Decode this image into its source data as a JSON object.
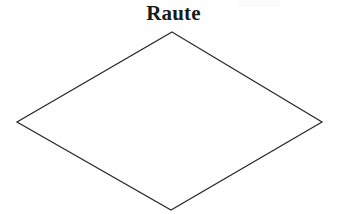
{
  "figure": {
    "title": "Raute",
    "title_color": "#1a1a1a",
    "background_color": "#ffffff",
    "width": 347,
    "height": 214
  },
  "shape": {
    "name": "Raute",
    "kind": "rhombus",
    "fill_color": "#ffffff",
    "stroke_color": "#2b2b2b",
    "stroke_width": 1.25,
    "points": "172,32 322,122 171,210 17,122",
    "vertices": [
      {
        "label": "top",
        "x": 172,
        "y": 32
      },
      {
        "label": "right",
        "x": 322,
        "y": 122
      },
      {
        "label": "bottom",
        "x": 171,
        "y": 210
      },
      {
        "label": "left",
        "x": 17,
        "y": 122
      }
    ],
    "diagonals": {
      "horizontal": 305,
      "vertical": 178
    }
  }
}
